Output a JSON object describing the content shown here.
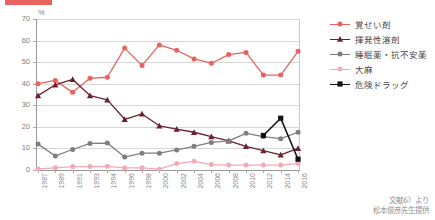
{
  "header": {
    "accent_color": "#e8625f"
  },
  "axes": {
    "y_unit": "%",
    "y_ticks": [
      "0",
      "10",
      "20",
      "30",
      "40",
      "50",
      "60",
      "70"
    ],
    "x_ticks": [
      "1987",
      "1989",
      "1991",
      "1993",
      "1994",
      "1996",
      "1998",
      "2000",
      "2002",
      "2004",
      "2006",
      "2008",
      "2010",
      "2012",
      "2014",
      "2016"
    ]
  },
  "legend": {
    "items": [
      {
        "label": "覚せい剤",
        "color": "#e8625f",
        "marker": "circle"
      },
      {
        "label": "揮発性溶剤",
        "color": "#6b2230",
        "marker": "triangle"
      },
      {
        "label": "睡眠薬・抗不安薬",
        "color": "#7f7f7f",
        "marker": "circle"
      },
      {
        "label": "大麻",
        "color": "#f2aab4",
        "marker": "circle"
      },
      {
        "label": "危険ドラッグ",
        "color": "#111111",
        "marker": "square"
      }
    ]
  },
  "source": {
    "line1": "文献6）より",
    "line2": "松本俊彦先生提供"
  },
  "chart_data": {
    "type": "line",
    "title": "",
    "xlabel": "",
    "ylabel": "%",
    "ylim": [
      0,
      70
    ],
    "grid": true,
    "legend_position": "right",
    "x": [
      "1987",
      "1989",
      "1991",
      "1993",
      "1994",
      "1996",
      "1998",
      "2000",
      "2002",
      "2004",
      "2006",
      "2008",
      "2010",
      "2012",
      "2014",
      "2016"
    ],
    "series": [
      {
        "name": "覚せい剤",
        "color": "#e8625f",
        "marker": "circle",
        "values": [
          40,
          41.5,
          36,
          42.5,
          43,
          56.5,
          48.5,
          58,
          55.5,
          51.5,
          49.5,
          53.5,
          54.5,
          44,
          44,
          55
        ]
      },
      {
        "name": "揮発性溶剤",
        "color": "#6b2230",
        "marker": "triangle",
        "values": [
          34.5,
          39.5,
          42,
          34.5,
          32.5,
          23.5,
          26,
          20.5,
          19,
          17.5,
          15.5,
          13.5,
          11,
          9,
          7,
          10
        ]
      },
      {
        "name": "睡眠薬・抗不安薬",
        "color": "#7f7f7f",
        "marker": "circle",
        "values": [
          12,
          6.5,
          9.5,
          12.3,
          12.5,
          6,
          7.8,
          7.8,
          9.3,
          11,
          12.8,
          13.5,
          17,
          15.5,
          14.5,
          17.5
        ]
      },
      {
        "name": "大麻",
        "color": "#f2aab4",
        "marker": "circle",
        "values": [
          0.5,
          1,
          1.6,
          1.6,
          1.7,
          1,
          1,
          0.4,
          3,
          4,
          2.5,
          2.3,
          2.3,
          2.3,
          2.3,
          3
        ]
      },
      {
        "name": "危険ドラッグ",
        "color": "#111111",
        "marker": "square",
        "values": [
          null,
          null,
          null,
          null,
          null,
          null,
          null,
          null,
          null,
          null,
          null,
          null,
          null,
          16,
          24,
          5
        ]
      }
    ]
  }
}
